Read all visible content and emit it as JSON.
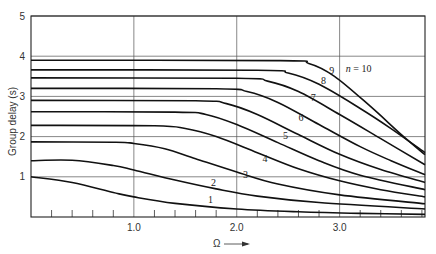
{
  "chart_data": {
    "type": "line",
    "title": "",
    "xlabel": "Ω",
    "ylabel": "Group delay (s)",
    "xlim": [
      0,
      3.83
    ],
    "ylim": [
      0,
      5
    ],
    "grid": true,
    "x_ticks": [
      {
        "value": 1.0,
        "label": "1.0"
      },
      {
        "value": 2.0,
        "label": "2.0"
      },
      {
        "value": 3.0,
        "label": "3.0"
      }
    ],
    "y_ticks": [
      {
        "value": 1,
        "label": "1"
      },
      {
        "value": 2,
        "label": "2"
      },
      {
        "value": 3,
        "label": "3"
      },
      {
        "value": 4,
        "label": "4"
      },
      {
        "value": 5,
        "label": "5"
      }
    ],
    "minor_x_step": 0.2,
    "series": [
      {
        "name": "1",
        "label": "1",
        "label_pos": [
          1.72,
          0.35
        ],
        "points": [
          [
            0,
            1.0
          ],
          [
            0.4,
            0.86
          ],
          [
            0.8,
            0.61
          ],
          [
            1.0,
            0.5
          ],
          [
            1.4,
            0.34
          ],
          [
            2.0,
            0.2
          ],
          [
            2.6,
            0.13
          ],
          [
            3.2,
            0.09
          ],
          [
            3.83,
            0.065
          ]
        ]
      },
      {
        "name": "2",
        "label": "2",
        "label_pos": [
          1.75,
          0.78
        ],
        "points": [
          [
            0,
            1.4
          ],
          [
            0.4,
            1.41
          ],
          [
            0.8,
            1.28
          ],
          [
            1.0,
            1.17
          ],
          [
            1.4,
            0.92
          ],
          [
            1.8,
            0.7
          ],
          [
            2.2,
            0.52
          ],
          [
            2.8,
            0.36
          ],
          [
            3.83,
            0.2
          ]
        ]
      },
      {
        "name": "3",
        "label": "3",
        "label_pos": [
          2.06,
          0.98
        ],
        "points": [
          [
            0,
            1.87
          ],
          [
            0.8,
            1.86
          ],
          [
            1.0,
            1.83
          ],
          [
            1.3,
            1.7
          ],
          [
            1.6,
            1.45
          ],
          [
            2.0,
            1.12
          ],
          [
            2.4,
            0.82
          ],
          [
            3.0,
            0.55
          ],
          [
            3.83,
            0.33
          ]
        ]
      },
      {
        "name": "4",
        "label": "4",
        "label_pos": [
          2.25,
          1.38
        ],
        "points": [
          [
            0,
            2.28
          ],
          [
            1.2,
            2.27
          ],
          [
            1.5,
            2.2
          ],
          [
            1.8,
            2.0
          ],
          [
            2.2,
            1.6
          ],
          [
            2.6,
            1.2
          ],
          [
            3.0,
            0.9
          ],
          [
            3.4,
            0.68
          ],
          [
            3.83,
            0.5
          ]
        ]
      },
      {
        "name": "5",
        "label": "5",
        "label_pos": [
          2.45,
          1.95
        ],
        "points": [
          [
            0,
            2.62
          ],
          [
            1.4,
            2.61
          ],
          [
            1.7,
            2.55
          ],
          [
            2.0,
            2.3
          ],
          [
            2.4,
            1.85
          ],
          [
            2.8,
            1.4
          ],
          [
            3.2,
            1.04
          ],
          [
            3.83,
            0.68
          ]
        ]
      },
      {
        "name": "6",
        "label": "6",
        "label_pos": [
          2.6,
          2.4
        ],
        "points": [
          [
            0,
            2.9
          ],
          [
            1.6,
            2.89
          ],
          [
            1.9,
            2.82
          ],
          [
            2.2,
            2.55
          ],
          [
            2.6,
            2.05
          ],
          [
            3.0,
            1.56
          ],
          [
            3.4,
            1.18
          ],
          [
            3.83,
            0.86
          ]
        ]
      },
      {
        "name": "7",
        "label": "7",
        "label_pos": [
          2.72,
          2.88
        ],
        "points": [
          [
            0,
            3.2
          ],
          [
            1.8,
            3.19
          ],
          [
            2.1,
            3.12
          ],
          [
            2.4,
            2.85
          ],
          [
            2.8,
            2.3
          ],
          [
            3.2,
            1.75
          ],
          [
            3.5,
            1.4
          ],
          [
            3.83,
            1.05
          ]
        ]
      },
      {
        "name": "8",
        "label": "8",
        "label_pos": [
          2.82,
          3.3
        ],
        "points": [
          [
            0,
            3.46
          ],
          [
            2.0,
            3.45
          ],
          [
            2.3,
            3.38
          ],
          [
            2.6,
            3.12
          ],
          [
            3.0,
            2.55
          ],
          [
            3.4,
            1.95
          ],
          [
            3.83,
            1.3
          ]
        ]
      },
      {
        "name": "9",
        "label": "9",
        "label_pos": [
          2.9,
          3.55
        ],
        "points": [
          [
            0,
            3.66
          ],
          [
            2.2,
            3.65
          ],
          [
            2.5,
            3.58
          ],
          [
            2.8,
            3.3
          ],
          [
            3.2,
            2.7
          ],
          [
            3.5,
            2.2
          ],
          [
            3.83,
            1.6
          ]
        ]
      },
      {
        "name": "10",
        "label": "n = 10",
        "label_pos": [
          3.06,
          3.6
        ],
        "points": [
          [
            0,
            3.9
          ],
          [
            2.4,
            3.89
          ],
          [
            2.7,
            3.82
          ],
          [
            2.95,
            3.5
          ],
          [
            3.3,
            2.75
          ],
          [
            3.6,
            2.05
          ],
          [
            3.83,
            1.55
          ]
        ]
      }
    ]
  },
  "labels": {
    "ylabel": "Group delay (s)",
    "xlabel": "Ω",
    "corner_mark": "-5"
  }
}
